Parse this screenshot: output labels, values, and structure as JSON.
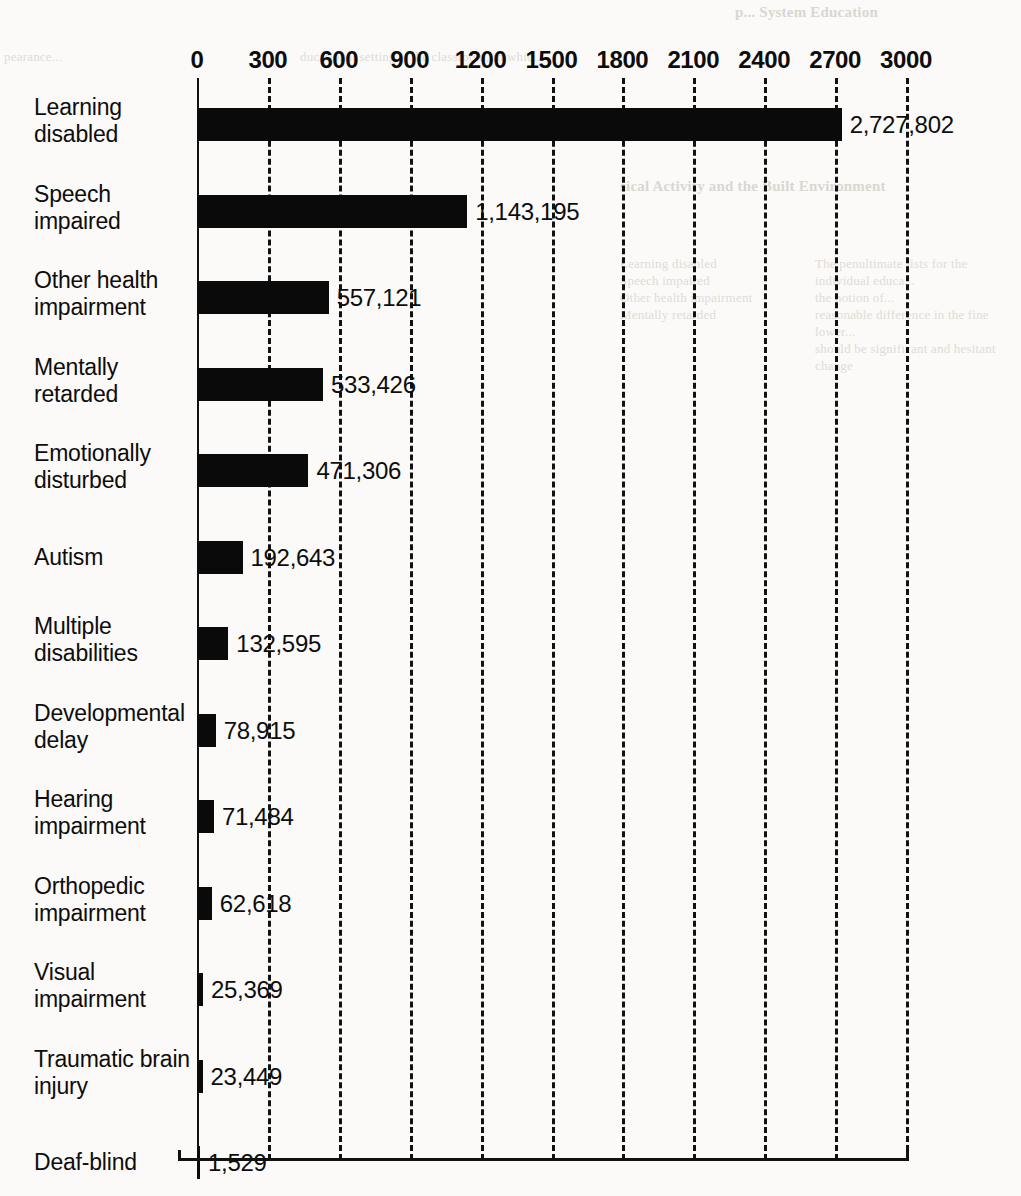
{
  "page": {
    "background_color": "#fbfaf8",
    "ink_color": "#0a0a0a"
  },
  "showthrough_text": {
    "header_right": "p... System Education",
    "top_left": "pearance...",
    "top_right": "ducational setting is the classroom, in whic...",
    "right_heading": "sical Activity and the Built Environment",
    "col_a": "Learning disabled\nSpeech impaired\nOther health impairment\nMentally retarded",
    "col_b": "The penultimate lists for the individual educa...\nthe notion of...\nreasonable difference in the fine lower...\nshould be significant and hesitant change"
  },
  "chart_data": {
    "type": "bar",
    "orientation": "horizontal",
    "title": "",
    "subtitle": "",
    "xlabel": "",
    "ylabel": "",
    "xlim": [
      0,
      3000
    ],
    "xticks": [
      0,
      300,
      600,
      900,
      1200,
      1500,
      1800,
      2100,
      2400,
      2700,
      3000
    ],
    "xtick_labels": [
      "0",
      "300",
      "600",
      "900",
      "1200",
      "1500",
      "1800",
      "2100",
      "2400",
      "2700",
      "3000"
    ],
    "tick_axis_position": "top",
    "grid": true,
    "grid_style": "dashed-vertical",
    "legend": null,
    "value_units": "thousands",
    "categories": [
      "Learning disabled",
      "Speech impaired",
      "Other health impairment",
      "Mentally retarded",
      "Emotionally disturbed",
      "Autism",
      "Multiple disabilities",
      "Developmental delay",
      "Hearing impairment",
      "Orthopedic impairment",
      "Visual impairment",
      "Traumatic brain injury",
      "Deaf-blind"
    ],
    "values": [
      2727.802,
      1143.195,
      557.121,
      533.426,
      471.306,
      192.643,
      132.595,
      78.915,
      71.484,
      62.618,
      25.369,
      23.449,
      1.529
    ],
    "data_labels": [
      "2,727,802",
      "1,143,195",
      "557,121",
      "533,426",
      "471,306",
      "192,643",
      "132,595",
      "78,915",
      "71,484",
      "62,618",
      "25,369",
      "23,449",
      "1,529"
    ],
    "rows": [
      {
        "label_line1": "Learning",
        "label_line2": "disabled",
        "value": 2727.802,
        "data_label": "2,727,802"
      },
      {
        "label_line1": "Speech",
        "label_line2": "impaired",
        "value": 1143.195,
        "data_label": "1,143,195"
      },
      {
        "label_line1": "Other health",
        "label_line2": "impairment",
        "value": 557.121,
        "data_label": "557,121"
      },
      {
        "label_line1": "Mentally",
        "label_line2": "retarded",
        "value": 533.426,
        "data_label": "533,426"
      },
      {
        "label_line1": "Emotionally",
        "label_line2": "disturbed",
        "value": 471.306,
        "data_label": "471,306"
      },
      {
        "label_line1": "Autism",
        "label_line2": "",
        "value": 192.643,
        "data_label": "192,643"
      },
      {
        "label_line1": "Multiple",
        "label_line2": "disabilities",
        "value": 132.595,
        "data_label": "132,595"
      },
      {
        "label_line1": "Developmental",
        "label_line2": "delay",
        "value": 78.915,
        "data_label": "78,915"
      },
      {
        "label_line1": "Hearing",
        "label_line2": "impairment",
        "value": 71.484,
        "data_label": "71,484"
      },
      {
        "label_line1": "Orthopedic",
        "label_line2": "impairment",
        "value": 62.618,
        "data_label": "62,618"
      },
      {
        "label_line1": "Visual",
        "label_line2": "impairment",
        "value": 25.369,
        "data_label": "25,369"
      },
      {
        "label_line1": "Traumatic brain",
        "label_line2": "injury",
        "value": 23.449,
        "data_label": "23,449"
      },
      {
        "label_line1": "Deaf-blind",
        "label_line2": "",
        "value": 1.529,
        "data_label": "1,529"
      }
    ]
  }
}
